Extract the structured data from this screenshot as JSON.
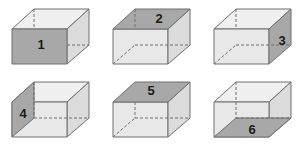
{
  "figure": {
    "width": 303,
    "height": 146,
    "background_color": "#ffffff",
    "columns": 3,
    "rows": 2,
    "colors": {
      "shaded_face": "#a8a8a8",
      "front_face_light": "#e8e8e8",
      "side_face_light": "#dcdcdc",
      "top_face_light": "#f0f0f0",
      "edge_solid": "#6e6e6e",
      "edge_hidden_dashed": "#6e6e6e",
      "label_text": "#1a1a1a"
    },
    "projection": "oblique-cabinet"
  },
  "boxes": [
    {
      "id": "box-1",
      "label": "1",
      "shaded_face": "front",
      "label_face": "front",
      "label_x": 41,
      "label_y": 44,
      "cell_left": 0,
      "cell_top": 0
    },
    {
      "id": "box-2",
      "label": "2",
      "shaded_face": "top",
      "label_face": "top",
      "label_x": 58,
      "label_y": 18,
      "cell_left": 101,
      "cell_top": 0
    },
    {
      "id": "box-3",
      "label": "3",
      "shaded_face": "right",
      "label_face": "right",
      "label_x": 81,
      "label_y": 40,
      "cell_left": 202,
      "cell_top": 0
    },
    {
      "id": "box-4",
      "label": "4",
      "shaded_face": "left",
      "label_face": "left",
      "label_x": 23,
      "label_y": 40,
      "cell_left": 0,
      "cell_top": 73
    },
    {
      "id": "box-5",
      "label": "5",
      "shaded_face": "top",
      "label_face": "top",
      "label_x": 50,
      "label_y": 16,
      "cell_left": 101,
      "cell_top": 73
    },
    {
      "id": "box-6",
      "label": "6",
      "shaded_face": "bottom",
      "label_face": "bottom",
      "label_x": 50,
      "label_y": 56,
      "cell_left": 202,
      "cell_top": 73
    }
  ]
}
